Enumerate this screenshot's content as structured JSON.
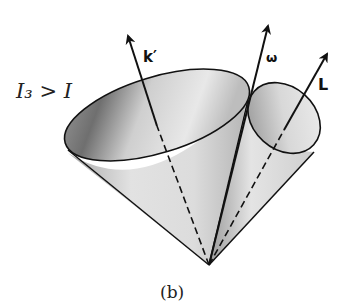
{
  "figure": {
    "condition_label": "I₃ > I",
    "caption": "(b)",
    "vectors": [
      {
        "name": "k-prime",
        "label": "k′"
      },
      {
        "name": "omega",
        "label": "ω"
      },
      {
        "name": "L",
        "label": "L"
      }
    ],
    "cones": [
      {
        "name": "body-cone",
        "description": "large cone around k′"
      },
      {
        "name": "space-cone",
        "description": "small cone around L"
      }
    ],
    "colors": {
      "line": "#111111",
      "cone_light": "#eeeeee",
      "cone_mid": "#c8c8c8",
      "cone_dark": "#8a8a8a"
    }
  }
}
